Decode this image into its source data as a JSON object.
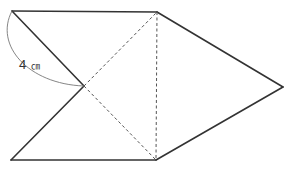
{
  "diagram": {
    "type": "net-of-pyramid",
    "vertices": {
      "top_left": [
        12,
        11
      ],
      "top_right": [
        157,
        12
      ],
      "bottom_left": [
        11,
        160
      ],
      "bottom_right": [
        156,
        160
      ],
      "center": [
        84,
        86
      ],
      "right_apex": [
        283,
        87
      ]
    },
    "edges": {
      "solid": [
        [
          "top_left",
          "top_right"
        ],
        [
          "top_left",
          "center"
        ],
        [
          "center",
          "bottom_left"
        ],
        [
          "bottom_left",
          "bottom_right"
        ],
        [
          "top_right",
          "right_apex"
        ],
        [
          "bottom_right",
          "right_apex"
        ]
      ],
      "dashed": [
        [
          "center",
          "top_right"
        ],
        [
          "center",
          "bottom_right"
        ],
        [
          "top_right",
          "bottom_right"
        ]
      ]
    },
    "measurement": {
      "value": "4",
      "unit": "㎝",
      "between": [
        "top_left",
        "center"
      ]
    }
  }
}
